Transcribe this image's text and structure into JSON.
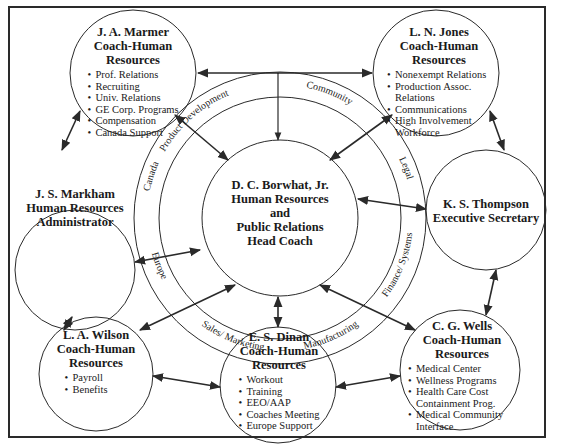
{
  "center": {
    "name": "D. C. Borwhat, Jr.",
    "title_lines": [
      "Human Resources",
      "and",
      "Public Relations",
      "Head Coach"
    ]
  },
  "ring_segments": [
    "Product Development",
    "Community",
    "Legal",
    "Finance/ Systems",
    "Manufacturing",
    "Sales/ Marketing",
    "Europe",
    "Canada"
  ],
  "nodes": {
    "marmer": {
      "name": "J. A. Marmer",
      "role_lines": [
        "Coach-Human",
        "Resources"
      ],
      "items": [
        "Prof. Relations",
        "Recruiting",
        "Univ. Relations",
        "GE Corp. Programs",
        "Compensation",
        "Canada Support"
      ]
    },
    "jones": {
      "name": "L. N. Jones",
      "role_lines": [
        "Coach-Human",
        "Resources"
      ],
      "items": [
        "Nonexempt Relations",
        "Production Assoc. Relations",
        "Communications",
        "High Involvement Workforce"
      ]
    },
    "markham": {
      "name": "J. S. Markham",
      "role_lines": [
        "Human Resources",
        "Administrator"
      ],
      "items": []
    },
    "thompson": {
      "name": "K. S. Thompson",
      "role_lines": [
        "Executive Secretary"
      ],
      "items": []
    },
    "wilson": {
      "name": "L. A. Wilson",
      "role_lines": [
        "Coach-Human",
        "Resources"
      ],
      "items": [
        "Payroll",
        "Benefits"
      ]
    },
    "dinan": {
      "name": "E. S. Dinan",
      "role_lines": [
        "Coach-Human",
        "Resources"
      ],
      "items": [
        "Workout",
        "Training",
        "EEO/AAP",
        "Coaches Meeting",
        "Europe Support"
      ]
    },
    "wells": {
      "name": "C. G. Wells",
      "role_lines": [
        "Coach-Human",
        "Resources"
      ],
      "items": [
        "Medical Center",
        "Wellness Programs",
        "Health Care Cost Containment Prog.",
        "Medical Community Interface"
      ]
    }
  },
  "colors": {
    "line": "#2a2a2a",
    "background": "#ffffff",
    "text": "#1a1a1a"
  }
}
